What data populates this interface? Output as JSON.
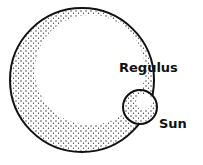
{
  "diagram": {
    "labels": {
      "regulus": "Regulus",
      "sun": "Sun"
    },
    "shapes": [
      {
        "name": "regulus",
        "cx": 82,
        "cy": 80,
        "r": 72
      },
      {
        "name": "sun",
        "cx": 140,
        "cy": 107,
        "r": 17
      }
    ],
    "colors": {
      "stroke": "#111111",
      "stipple": "#222222",
      "background": "#ffffff"
    }
  }
}
